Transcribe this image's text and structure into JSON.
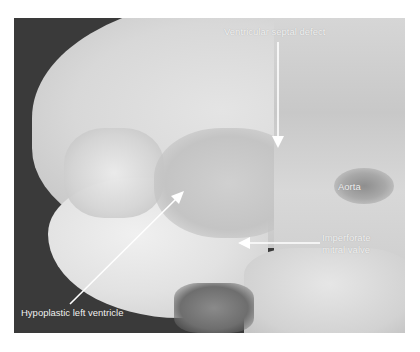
{
  "figure": {
    "labels": [
      {
        "id": "vsd",
        "text": "Ventricular septal defect"
      },
      {
        "id": "aorta",
        "text": "Aorta"
      },
      {
        "id": "mitral",
        "line1": "Imperforate",
        "line2": "mitral valve"
      },
      {
        "id": "hlv",
        "text": "Hypoplastic left ventricle"
      }
    ],
    "colors": {
      "background_dark": "#3a3a3a",
      "tissue_light": "#e6e6e6",
      "tissue_mid": "#cfcfcf",
      "label_text": "#f2f2f2",
      "arrow": "#ffffff"
    }
  }
}
